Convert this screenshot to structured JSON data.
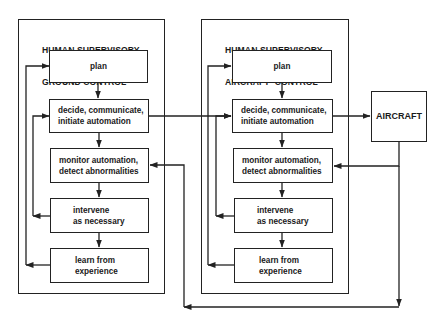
{
  "diagram": {
    "ground": {
      "title_line1": "HUMAN SUPERVISORY",
      "title_line2": "GROUND CONTROL",
      "steps": [
        {
          "line1": "plan",
          "line2": ""
        },
        {
          "line1": "decide, communicate,",
          "line2": "initiate automation"
        },
        {
          "line1": "monitor automation,",
          "line2": "detect abnormalities"
        },
        {
          "line1": "intervene",
          "line2": "as necessary"
        },
        {
          "line1": "learn from",
          "line2": "experience"
        }
      ]
    },
    "aircraft_control": {
      "title_line1": "HUMAN SUPERVISORY",
      "title_line2": "AIRCRAFT  CONTROL",
      "steps": [
        {
          "line1": "plan",
          "line2": ""
        },
        {
          "line1": "decide, communicate,",
          "line2": "initiate automation"
        },
        {
          "line1": "monitor automation,",
          "line2": "detect abnormalities"
        },
        {
          "line1": "intervene",
          "line2": "as necessary"
        },
        {
          "line1": "learn from",
          "line2": "experience"
        }
      ]
    },
    "aircraft": {
      "label": "AIRCRAFT"
    },
    "colors": {
      "line": "#222222",
      "background": "#ffffff"
    }
  }
}
